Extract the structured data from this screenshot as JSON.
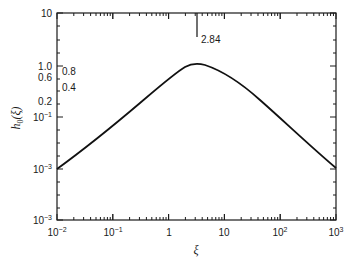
{
  "chart_data": {
    "type": "line",
    "title": "",
    "xlabel": "ξ",
    "ylabel": "h0(ξ)",
    "xscale": "log",
    "yscale": "log",
    "xlim": [
      0.01,
      1000
    ],
    "x_ticks": [
      "10^-2",
      "10^-1",
      "1",
      "10",
      "10^2",
      "10^3"
    ],
    "y_tick_labels": [
      "10",
      "1.0",
      "0.6",
      "0.2",
      "10^-1",
      "10^-3",
      "10^-3"
    ],
    "inner_labels": [
      "0.8",
      "0.4"
    ],
    "annotation": {
      "text": "2.84",
      "x": 2.84
    },
    "series": [
      {
        "name": "h0(ξ)",
        "x": [
          0.01,
          0.03,
          0.1,
          0.3,
          1,
          2.84,
          10,
          30,
          100,
          300,
          1000
        ],
        "y_pixel_rows": [
          169,
          150,
          128,
          105,
          79,
          66,
          79,
          100,
          125,
          147,
          168
        ]
      }
    ],
    "grid": false,
    "legend": null
  },
  "labels": {
    "y_axis_title_main": "h",
    "y_axis_title_sub": "0",
    "y_axis_title_arg": "(ξ)",
    "x_axis_title": "ξ",
    "annotation": "2.84",
    "inner_08": "0.8",
    "inner_04": "0.4",
    "y10": "10",
    "y1": "1.0",
    "y06": "0.6",
    "y02": "0.2",
    "ym1_base": "10",
    "ym1_exp": "−1",
    "ym3a_base": "10",
    "ym3a_exp": "−3",
    "ym3b_base": "10",
    "ym3b_exp": "−3",
    "xm2_base": "10",
    "xm2_exp": "−2",
    "xm1_base": "10",
    "xm1_exp": "−1",
    "x1": "1",
    "x10": "10",
    "x2_base": "10",
    "x2_exp": "2",
    "x3_base": "10",
    "x3_exp": "3"
  }
}
